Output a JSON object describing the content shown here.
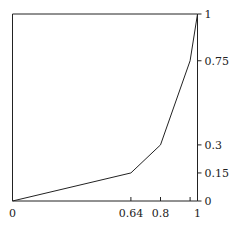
{
  "chart_data": {
    "type": "line",
    "title": "",
    "xlabel": "",
    "ylabel": "",
    "xlim": [
      0,
      1
    ],
    "ylim": [
      0,
      1
    ],
    "grid": false,
    "legend": null,
    "series": [
      {
        "name": "curve",
        "x": [
          0,
          0.64,
          0.8,
          0.96,
          1
        ],
        "y": [
          0,
          0.15,
          0.3,
          0.75,
          1
        ]
      }
    ],
    "x_ticks": [
      0,
      0.64,
      0.8,
      0.96,
      1
    ],
    "x_tick_labels": [
      "0",
      "0.64",
      "0.8",
      "",
      "1"
    ],
    "y_ticks": [
      0,
      0.15,
      0.3,
      0.75,
      1
    ],
    "y_tick_labels": [
      "0",
      "0.15",
      "0.3",
      "0.75",
      "1"
    ],
    "y_axis_position": "right",
    "line_color": "#222222"
  }
}
